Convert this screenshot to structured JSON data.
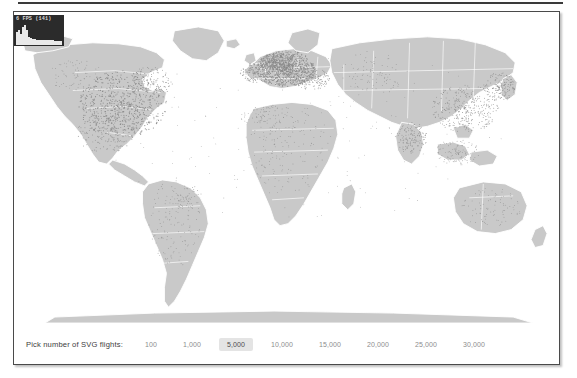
{
  "window": {
    "background_color": "#ffffff",
    "frame_border_color": "#4a4a4a"
  },
  "fps_meter": {
    "readout": "6 FPS (141)",
    "background_color": "#2b2b2b",
    "bar_color": "#e9e9e9",
    "history": [
      62,
      70,
      55,
      88,
      96,
      72,
      40,
      34,
      30,
      28,
      26,
      25,
      24,
      24,
      23,
      23,
      22,
      22,
      22,
      21,
      21,
      21,
      20
    ]
  },
  "map": {
    "land_color": "#c9c9c9",
    "border_color": "#ffffff",
    "dot_color": "#8a8a8a",
    "ocean_color": "#ffffff",
    "description": "World map of flight origin/destination points"
  },
  "controls": {
    "label": "Pick number of SVG flights:",
    "selected_value": "5,000",
    "selected_background": "#e4e4e4",
    "options": [
      {
        "label": "100",
        "value": 100,
        "selected": false
      },
      {
        "label": "1,000",
        "value": 1000,
        "selected": false
      },
      {
        "label": "5,000",
        "value": 5000,
        "selected": true
      },
      {
        "label": "10,000",
        "value": 10000,
        "selected": false
      },
      {
        "label": "15,000",
        "value": 15000,
        "selected": false
      },
      {
        "label": "20,000",
        "value": 20000,
        "selected": false
      },
      {
        "label": "25,000",
        "value": 25000,
        "selected": false
      },
      {
        "label": "30,000",
        "value": 30000,
        "selected": false
      }
    ]
  }
}
